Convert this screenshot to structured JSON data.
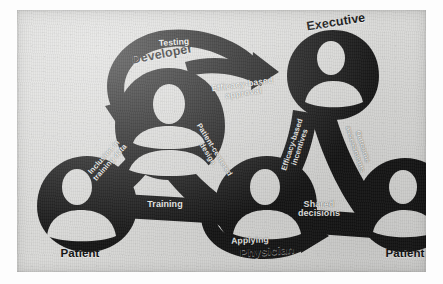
{
  "figure": {
    "background_color": "#d9d9d7",
    "ink_color": "#141414"
  },
  "nodes": [
    {
      "id": "patient-left",
      "label": "Patient",
      "x": 62,
      "y": 200
    },
    {
      "id": "developer",
      "label": "Developer",
      "x": 140,
      "y": 62
    },
    {
      "id": "physician",
      "label": "Physician",
      "x": 248,
      "y": 222
    },
    {
      "id": "executive",
      "label": "Executive",
      "x": 318,
      "y": 32
    },
    {
      "id": "patient-right",
      "label": "Patient",
      "x": 394,
      "y": 233
    }
  ],
  "edges": [
    {
      "id": "inclusion-training-data",
      "label": "Inclusion in\ntraining data",
      "from": "patient-left",
      "to": "developer",
      "rotation": -48
    },
    {
      "id": "training",
      "label": "Training",
      "from": "patient-left",
      "to": "developer",
      "rotation": 0
    },
    {
      "id": "patient-centered-design",
      "label": "Patient-centered\ndesign",
      "from": "developer",
      "to": "physician",
      "rotation": 58
    },
    {
      "id": "efficacy-based-incentives",
      "label": "Efficacy-based\nincentives",
      "from": "physician",
      "to": "executive",
      "rotation": -72
    },
    {
      "id": "outcome-assessments",
      "label": "Outcome\nassessments",
      "from": "executive",
      "to": "patient-right",
      "rotation": 72
    },
    {
      "id": "shared-decisions",
      "label": "Shared\ndecisions",
      "from": "physician",
      "to": "patient-right",
      "rotation": 0
    }
  ],
  "flow_arrows": [
    {
      "id": "testing",
      "label": "Testing",
      "position": "top-left",
      "direction": "counter-clockwise"
    },
    {
      "id": "efficacy-based-approval",
      "label": "Efficacy-based\napproval",
      "position": "top-right",
      "direction": "clockwise"
    },
    {
      "id": "applying",
      "label": "Applying",
      "position": "bottom-center",
      "direction": "clockwise"
    }
  ]
}
